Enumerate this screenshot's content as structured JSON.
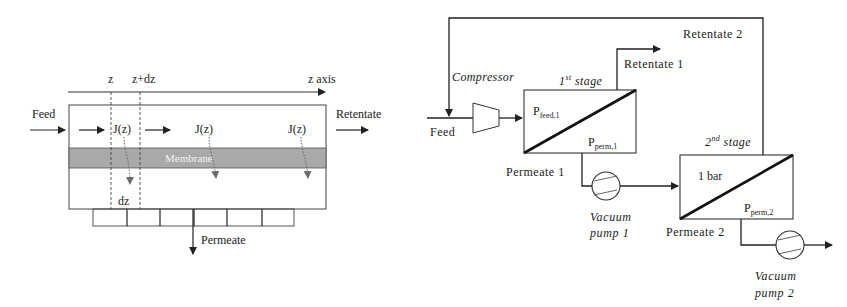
{
  "left_diagram": {
    "axis": {
      "z": "z",
      "z_dz": "z+dz",
      "z_axis": "z axis"
    },
    "feed": "Feed",
    "retentate": "Retentate",
    "flux": [
      "J(z)",
      "J(z)",
      "J(z)"
    ],
    "membrane": "Membrane",
    "dz": "dz",
    "permeate": "Permeate",
    "colors": {
      "membrane": "#a9a9a9",
      "flux_arrow": "#6b6b6b",
      "line": "#333333"
    }
  },
  "right_diagram": {
    "feed": "Feed",
    "compressor": "Compressor",
    "stage1": {
      "title_sup": "st",
      "title_num": "1",
      "title_rest": " stage",
      "p_feed": "P",
      "p_feed_sub": "feed,1",
      "p_perm": "P",
      "p_perm_sub": "perm,1"
    },
    "stage2": {
      "title_sup": "nd",
      "title_num": "2",
      "title_rest": " stage",
      "p_feed": "1 bar",
      "p_perm": "P",
      "p_perm_sub": "perm,2"
    },
    "retentate1": "Retentate 1",
    "retentate2": "Retentate 2",
    "permeate1": "Permeate 1",
    "permeate2": "Permeate 2",
    "pump1": {
      "line1": "Vacuum",
      "line2": "pump 1"
    },
    "pump2": {
      "line1": "Vacuum",
      "line2": "pump 2"
    }
  }
}
